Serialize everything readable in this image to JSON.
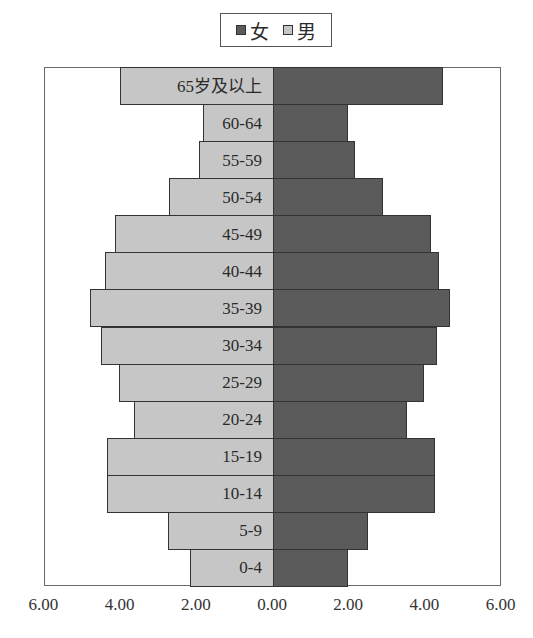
{
  "chart_data": {
    "type": "bar",
    "orientation": "horizontal",
    "subtype": "population-pyramid",
    "title": "",
    "xlabel": "",
    "ylabel": "",
    "categories": [
      "65岁及以上",
      "60-64",
      "55-59",
      "50-54",
      "45-49",
      "40-44",
      "35-39",
      "30-34",
      "25-29",
      "20-24",
      "15-19",
      "10-14",
      "5-9",
      "0-4"
    ],
    "series": [
      {
        "name": "女",
        "side": "right",
        "color": "#5b5b5b",
        "values": [
          4.46,
          1.97,
          2.15,
          2.89,
          4.15,
          4.36,
          4.65,
          4.3,
          3.97,
          3.52,
          4.25,
          4.25,
          2.49,
          1.97
        ]
      },
      {
        "name": "男",
        "side": "left",
        "color": "#c6c6c6",
        "values": [
          4.02,
          1.84,
          1.94,
          2.73,
          4.15,
          4.41,
          4.8,
          4.51,
          4.04,
          3.65,
          4.35,
          4.35,
          2.76,
          2.18
        ]
      }
    ],
    "xlim": [
      -6,
      6
    ],
    "xticks": [
      "6.00",
      "4.00",
      "2.00",
      "0.00",
      "2.00",
      "4.00",
      "6.00"
    ],
    "grid": false,
    "legend": {
      "position": "top",
      "entries": [
        "女",
        "男"
      ]
    }
  }
}
